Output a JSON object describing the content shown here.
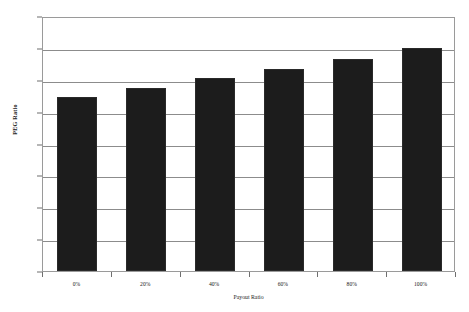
{
  "chart_data": {
    "type": "bar",
    "title": "",
    "xlabel": "Payout Ratio",
    "ylabel": "PEG Ratio",
    "categories": [
      "0%",
      "20%",
      "40%",
      "60%",
      "80%",
      "100%"
    ],
    "values": [
      1.09,
      1.15,
      1.21,
      1.27,
      1.33,
      1.4
    ],
    "ylim": [
      0,
      1.6
    ],
    "ytick_labels": [
      "0",
      "0.2",
      "0.4",
      "0.6",
      "0.8",
      "1",
      "1.2",
      "1.4",
      "1.6"
    ],
    "ytick_values": [
      0,
      0.2,
      0.4,
      0.6,
      0.8,
      1,
      1.2,
      1.4,
      1.6
    ],
    "grid": true,
    "legend": false,
    "series": [
      {
        "name": "PEG Ratio",
        "color": "#1c1c1c",
        "values": [
          1.09,
          1.15,
          1.21,
          1.27,
          1.33,
          1.4
        ]
      }
    ]
  }
}
